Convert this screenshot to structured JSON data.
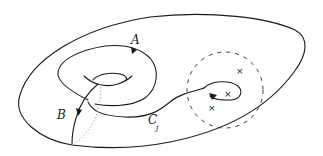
{
  "diagram": {
    "type": "topology-surface",
    "labels": {
      "a": "A",
      "b": "B",
      "c_main": "C",
      "c_sub": "j"
    },
    "marked_point_glyph": "×",
    "marked_point_count": 3,
    "colors": {
      "ink": "#1a1a1a",
      "background": "#ffffff",
      "hidden_line": "#8a8a8a"
    }
  }
}
